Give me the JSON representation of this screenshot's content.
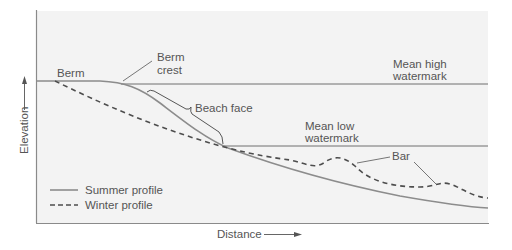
{
  "diagram": {
    "colors": {
      "panel_bg": "#f3f3f3",
      "frame": "#8a8a8a",
      "summer_line": "#8c8c8c",
      "winter_line": "#4d4d4d",
      "water_line": "#6f6f6f",
      "text": "#555555"
    },
    "axes": {
      "y_label": "Elevation",
      "x_label": "Distance"
    },
    "labels": {
      "berm": "Berm",
      "berm_crest_1": "Berm",
      "berm_crest_2": "crest",
      "beach_face": "Beach face",
      "mean_high_1": "Mean high",
      "mean_high_2": "watermark",
      "mean_low_1": "Mean low",
      "mean_low_2": "watermark",
      "bar": "Bar"
    },
    "legend": {
      "items": [
        {
          "label": "Summer profile",
          "style": "solid"
        },
        {
          "label": "Winter profile",
          "style": "dashed"
        }
      ]
    }
  }
}
